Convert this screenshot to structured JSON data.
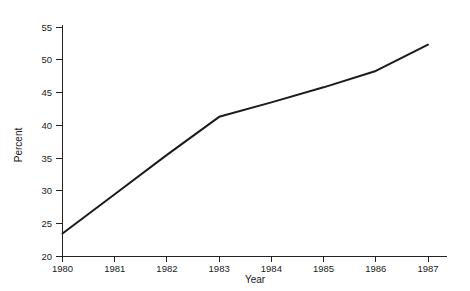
{
  "chart_data": {
    "type": "line",
    "title": "",
    "subtitle": "",
    "xlabel": "Year",
    "ylabel": "Percent",
    "x": [
      1980,
      1981,
      1982,
      1983,
      1984,
      1985,
      1986,
      1987
    ],
    "values": [
      23.5,
      29.5,
      35.5,
      41.3,
      43.5,
      45.8,
      48.3,
      52.3
    ],
    "series": [
      {
        "name": "Percent",
        "values": [
          23.5,
          29.5,
          35.5,
          41.3,
          43.5,
          45.8,
          48.3,
          52.3
        ],
        "color": "#1b1b1b"
      }
    ],
    "xlim": [
      1980,
      1987
    ],
    "ylim": [
      20,
      55
    ],
    "x_tick_labels": [
      "1980",
      "1981",
      "1982",
      "1983",
      "1984",
      "1985",
      "1986",
      "1987"
    ],
    "y_tick_labels": [
      "20",
      "25",
      "30",
      "35",
      "40",
      "45",
      "50",
      "55"
    ],
    "y_ticks": [
      20,
      25,
      30,
      35,
      40,
      45,
      50,
      55
    ],
    "grid": false,
    "legend": false,
    "legend_position": "none",
    "annotations": [],
    "line_color": "#1b1b1b",
    "background_color": "#ffffff",
    "axis_color": "#222222"
  },
  "axes": {
    "x_title": "Year",
    "y_title": "Percent"
  },
  "ticks": {
    "y": [
      {
        "label": "55",
        "value": 55
      },
      {
        "label": "50",
        "value": 50
      },
      {
        "label": "45",
        "value": 45
      },
      {
        "label": "40",
        "value": 40
      },
      {
        "label": "35",
        "value": 35
      },
      {
        "label": "30",
        "value": 30
      },
      {
        "label": "25",
        "value": 25
      },
      {
        "label": "20",
        "value": 20
      }
    ],
    "x": [
      {
        "label": "1980",
        "value": 1980
      },
      {
        "label": "1981",
        "value": 1981
      },
      {
        "label": "1982",
        "value": 1982
      },
      {
        "label": "1983",
        "value": 1983
      },
      {
        "label": "1984",
        "value": 1984
      },
      {
        "label": "1985",
        "value": 1985
      },
      {
        "label": "1986",
        "value": 1986
      },
      {
        "label": "1987",
        "value": 1987
      }
    ]
  }
}
